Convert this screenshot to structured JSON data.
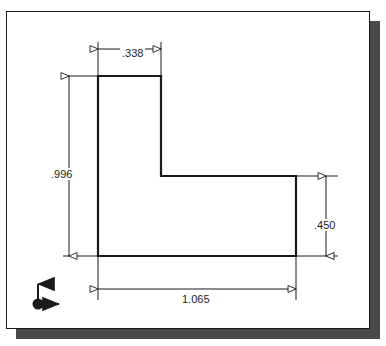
{
  "drawing": {
    "title": "L-bracket profile dimensioned sketch",
    "units_implied": "inches",
    "line_color": "#1a1a1a",
    "dimension_color": "#1a1a1a",
    "background_color": "#ffffff",
    "shadow_color": "#4a4a4a",
    "shape": {
      "name": "L-shape-profile",
      "outline_points": "97,75 160,75 160,175 295,175 295,255 97,255"
    },
    "dimensions": [
      {
        "id": "top",
        "value": ".338",
        "orientation": "horizontal",
        "measures": "vertical-leg-width"
      },
      {
        "id": "left",
        "value": ".996",
        "orientation": "vertical",
        "measures": "overall-height"
      },
      {
        "id": "right",
        "value": ".450",
        "orientation": "vertical",
        "measures": "horizontal-leg-height"
      },
      {
        "id": "bottom",
        "value": "1.065",
        "orientation": "horizontal",
        "measures": "overall-width"
      }
    ],
    "origin_marker": {
      "name": "origin-coordinate-marker",
      "x_axis_arrow": "right",
      "y_axis_arrow": "up"
    }
  }
}
